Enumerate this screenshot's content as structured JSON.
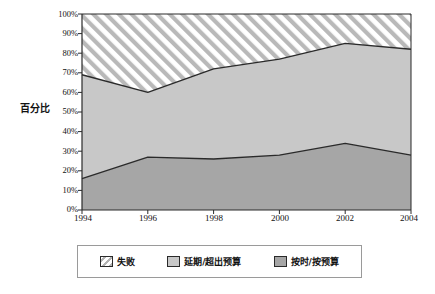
{
  "chart_data": {
    "type": "area",
    "stacked": true,
    "title": "",
    "subtitle": "",
    "xlabel": "",
    "ylabel": "百分比",
    "categories": [
      "1994",
      "1996",
      "1998",
      "2000",
      "2002",
      "2004"
    ],
    "x": [
      1994,
      1996,
      1998,
      2000,
      2002,
      2004
    ],
    "ylim": [
      0,
      100
    ],
    "y_tick_labels": [
      "0%",
      "10%",
      "20%",
      "30%",
      "40%",
      "50%",
      "60%",
      "70%",
      "80%",
      "90%",
      "100%"
    ],
    "y_tick_values": [
      0,
      10,
      20,
      30,
      40,
      50,
      60,
      70,
      80,
      90,
      100
    ],
    "grid": false,
    "legend_position": "bottom",
    "series": [
      {
        "name": "按时/按预算",
        "color": "#a6a6a6",
        "pattern": "solid",
        "values": [
          16,
          27,
          26,
          28,
          34,
          28
        ],
        "cumulative_top": [
          16,
          27,
          26,
          28,
          34,
          28
        ],
        "stack_order": 1
      },
      {
        "name": "延期/超出预算",
        "color": "#c8c8c8",
        "pattern": "solid",
        "values": [
          53,
          33,
          46,
          49,
          51,
          54
        ],
        "cumulative_top": [
          69,
          60,
          72,
          77,
          85,
          82
        ],
        "stack_order": 2
      },
      {
        "name": "失败",
        "color": "#ffffff",
        "pattern": "diagonal-hatch",
        "values": [
          31,
          40,
          28,
          23,
          15,
          18
        ],
        "cumulative_top": [
          100,
          100,
          100,
          100,
          100,
          100
        ],
        "stack_order": 3
      }
    ],
    "legend": [
      {
        "label": "失败",
        "swatch": "hatch",
        "color": "#ffffff"
      },
      {
        "label": "延期/超出预算",
        "swatch": "solid",
        "color": "#c8c8c8"
      },
      {
        "label": "按时/按预算",
        "swatch": "solid",
        "color": "#a6a6a6"
      }
    ],
    "colors": {
      "on_time": "#a6a6a6",
      "delayed": "#c8c8c8",
      "failed": "#ffffff",
      "axis": "#2a2a2a",
      "line": "#2a2a2a",
      "hatch": "#b4b4b4",
      "legend_border": "#9a9a9a",
      "background": "#ffffff"
    }
  }
}
